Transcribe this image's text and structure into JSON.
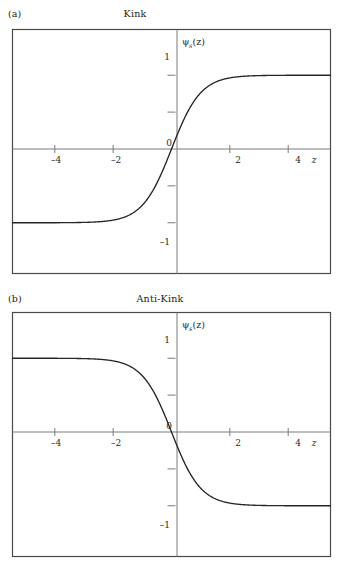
{
  "figure": {
    "background_color": "#ffffff",
    "curve_color": "#262626",
    "frame_color": "#4a4a4a",
    "axis_color": "#6e6e6e"
  },
  "panels": [
    {
      "key": "a",
      "panel_label": "(a)",
      "title": "Kink",
      "ylabel_main": "ψ",
      "ylabel_sub": "s",
      "ylabel_arg": "(z)",
      "xlabel": "z",
      "origin_label": "0",
      "x_tick_labels": [
        "–4",
        "–2",
        "2",
        "4"
      ],
      "y_tick_labels": [
        "1",
        "–1"
      ]
    },
    {
      "key": "b",
      "panel_label": "(b)",
      "title": "Anti-Kink",
      "ylabel_main": "ψ",
      "ylabel_sub": "s",
      "ylabel_arg": "(z)",
      "xlabel": "z",
      "origin_label": "0",
      "x_tick_labels": [
        "–4",
        "–2",
        "2",
        "4"
      ],
      "y_tick_labels": [
        "1",
        "–1"
      ]
    }
  ],
  "chart_data": [
    {
      "type": "line",
      "title": "Kink",
      "panel": "(a)",
      "xlabel": "z",
      "ylabel": "ψs(z)",
      "xlim": [
        -5.45,
        5.45
      ],
      "ylim": [
        -1.62,
        1.62
      ],
      "x_ticks": [
        -4,
        -2,
        0,
        2,
        4
      ],
      "x_tick_labels": [
        "–4",
        "–2",
        "0",
        "2",
        "4"
      ],
      "y_ticks": [
        -1,
        -0.5,
        0,
        0.5,
        1
      ],
      "y_tick_labels": [
        "–1",
        "",
        "0",
        "",
        "1"
      ],
      "grid": false,
      "legend": null,
      "function": "tanh(z)",
      "x": [
        -5.45,
        -5.0,
        -4.5,
        -4.0,
        -3.5,
        -3.0,
        -2.5,
        -2.0,
        -1.5,
        -1.0,
        -0.75,
        -0.5,
        -0.25,
        0,
        0.25,
        0.5,
        0.75,
        1.0,
        1.5,
        2.0,
        2.5,
        3.0,
        3.5,
        4.0,
        4.5,
        5.0,
        5.45
      ],
      "y": [
        -1.0,
        -0.9999,
        -0.9998,
        -0.9993,
        -0.9982,
        -0.9951,
        -0.9866,
        -0.964,
        -0.9051,
        -0.7616,
        -0.6351,
        -0.4621,
        -0.2449,
        0.0,
        0.2449,
        0.4621,
        0.6351,
        0.7616,
        0.9051,
        0.964,
        0.9866,
        0.9951,
        0.9982,
        0.9993,
        0.9998,
        0.9999,
        1.0
      ]
    },
    {
      "type": "line",
      "title": "Anti-Kink",
      "panel": "(b)",
      "xlabel": "z",
      "ylabel": "ψs(z)",
      "xlim": [
        -5.45,
        5.45
      ],
      "ylim": [
        -1.62,
        1.62
      ],
      "x_ticks": [
        -4,
        -2,
        0,
        2,
        4
      ],
      "x_tick_labels": [
        "–4",
        "–2",
        "0",
        "2",
        "4"
      ],
      "y_ticks": [
        -1,
        -0.5,
        0,
        0.5,
        1
      ],
      "y_tick_labels": [
        "–1",
        "",
        "0",
        "",
        "1"
      ],
      "grid": false,
      "legend": null,
      "function": "-tanh(z)",
      "x": [
        -5.45,
        -5.0,
        -4.5,
        -4.0,
        -3.5,
        -3.0,
        -2.5,
        -2.0,
        -1.5,
        -1.0,
        -0.75,
        -0.5,
        -0.25,
        0,
        0.25,
        0.5,
        0.75,
        1.0,
        1.5,
        2.0,
        2.5,
        3.0,
        3.5,
        4.0,
        4.5,
        5.0,
        5.45
      ],
      "y": [
        1.0,
        0.9999,
        0.9998,
        0.9993,
        0.9982,
        0.9951,
        0.9866,
        0.964,
        0.9051,
        0.7616,
        0.6351,
        0.4621,
        0.2449,
        0.0,
        -0.2449,
        -0.4621,
        -0.6351,
        -0.7616,
        -0.9051,
        -0.964,
        -0.9866,
        -0.9951,
        -0.9982,
        -0.9993,
        -0.9998,
        -0.9999,
        -1.0
      ]
    }
  ]
}
